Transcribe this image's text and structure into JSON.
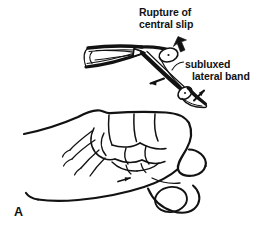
{
  "figure": {
    "panel_letter": "A",
    "caption_subject": "boutonniere-deformity",
    "background_color": "#ffffff",
    "ink_color": "#121212"
  },
  "annotations": {
    "rupture_label": {
      "line1": "Rupture of",
      "line2": "central slip"
    },
    "subluxed_label": {
      "line1": "subluxed",
      "line2": "lateral band"
    }
  },
  "markers": {
    "thick_arrow": "rupture-pointer-arrow",
    "thin_arrow_left": "lateral-band-direction-arrow",
    "thin_arrow_right": "lateral-band-volar-arrow",
    "leader_line": "subluxed-label-leader"
  },
  "anatomy": {
    "tendon_diagram": "extensor-tendon-mechanism",
    "hand_drawing": "clenched-fist-lateral-view",
    "joints": [
      "pip-joint",
      "dip-joint"
    ]
  }
}
